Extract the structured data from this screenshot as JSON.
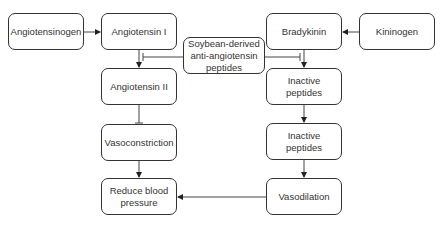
{
  "diagram": {
    "nodes": {
      "angiotensinogen": "Angiotensinogen",
      "angiotensin_i": "Angiotensin I",
      "soybean": "Soybean-derived anti-angiotensin peptides",
      "bradykinin": "Bradykinin",
      "kininogen": "Kininogen",
      "angiotensin_ii": "Angiotensin II",
      "inactive_peptides_1": "Inactive peptides",
      "vasoconstriction": "Vasoconstriction",
      "inactive_peptides_2": "Inactive peptides",
      "reduce_bp": "Reduce blood pressure",
      "vasodilation": "Vasodilation"
    },
    "edges": [
      {
        "from": "Angiotensinogen",
        "to": "Angiotensin I",
        "type": "arrow"
      },
      {
        "from": "Kininogen",
        "to": "Bradykinin",
        "type": "arrow"
      },
      {
        "from": "Angiotensin I",
        "to": "Angiotensin II",
        "type": "arrow"
      },
      {
        "from": "Bradykinin",
        "to": "Inactive peptides",
        "type": "arrow"
      },
      {
        "from": "Soybean-derived anti-angiotensin peptides",
        "to": "Angiotensin I → Angiotensin II",
        "type": "inhibit"
      },
      {
        "from": "Soybean-derived anti-angiotensin peptides",
        "to": "Bradykinin → Inactive peptides",
        "type": "inhibit"
      },
      {
        "from": "Angiotensin II",
        "to": "Vasoconstriction",
        "type": "inhibit"
      },
      {
        "from": "Vasoconstriction",
        "to": "Reduce blood pressure",
        "type": "arrow"
      },
      {
        "from": "Inactive peptides",
        "to": "Inactive peptides",
        "type": "arrow"
      },
      {
        "from": "Inactive peptides",
        "to": "Vasodilation",
        "type": "arrow"
      },
      {
        "from": "Vasodilation",
        "to": "Reduce blood pressure",
        "type": "arrow"
      }
    ],
    "colors": {
      "stroke": "#333333",
      "background": "#ffffff"
    }
  }
}
